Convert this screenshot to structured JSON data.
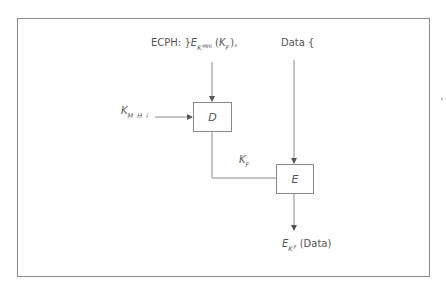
{
  "diagram": {
    "type": "block-diagram",
    "inputs": {
      "ecph": {
        "prefix": "ECPH:",
        "brace": "}",
        "symbol": "E",
        "subscript": "K",
        "sub_subscript": "MHi",
        "arg_open": "(",
        "arg_symbol": "K",
        "arg_subscript": "F",
        "arg_close": "),"
      },
      "data": {
        "label": "Data",
        "brace": "{"
      },
      "key": {
        "symbol": "K",
        "subscript": "M H i"
      }
    },
    "blocks": [
      {
        "id": "D",
        "label": "D"
      },
      {
        "id": "E",
        "label": "E"
      }
    ],
    "intermediate": {
      "symbol": "K",
      "subscript": "F"
    },
    "output": {
      "symbol": "E",
      "subscript": "K",
      "sub_subscript": "F",
      "argument": "(Data)"
    },
    "edges": [
      {
        "from": "ECPH",
        "to": "D"
      },
      {
        "from": "K_MHi",
        "to": "D"
      },
      {
        "from": "D",
        "to": "E",
        "label": "K_F"
      },
      {
        "from": "Data",
        "to": "E"
      },
      {
        "from": "E",
        "to": "E_KF(Data)"
      }
    ],
    "colors": {
      "line": "#8a8a8a",
      "text": "#555555",
      "background": "#ffffff"
    }
  }
}
